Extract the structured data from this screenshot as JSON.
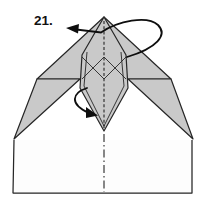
{
  "diagram": {
    "step_label": "21.",
    "kind": "origami-fold-step",
    "colors": {
      "background": "#ffffff",
      "paper_shaded": "#c9c9c9",
      "paper_white": "#fdfdfd",
      "line": "#262626",
      "arrow": "#0e0e0e",
      "label": "#111111"
    },
    "annotations": {
      "fold_arrow": "wrap-fold-left",
      "inner_fold_arrow": "curl-fold-down",
      "center_crease": "dashed-fold-line",
      "lower_crease": "dash-dot-fold-line"
    }
  }
}
